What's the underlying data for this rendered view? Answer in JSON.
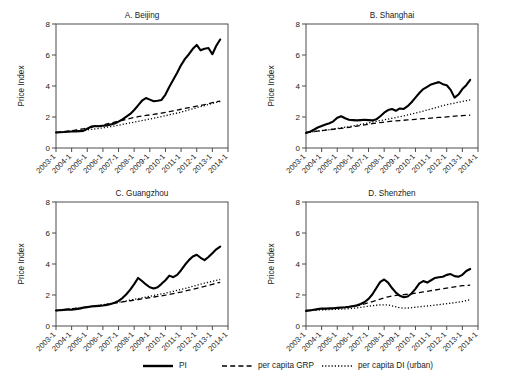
{
  "figure": {
    "ylabel": "Price Index",
    "legend": [
      {
        "name": "legend-pi",
        "label": "PI",
        "style": "solid"
      },
      {
        "name": "legend-grp",
        "label": "per capita GRP",
        "style": "dashed"
      },
      {
        "name": "legend-di",
        "label": "per capita DI (urban)",
        "style": "dotted"
      }
    ]
  },
  "chart_data": [
    {
      "type": "line",
      "title": "A. Beijing",
      "xlabel": "",
      "ylabel": "Price Index",
      "ylim": [
        0,
        8
      ],
      "yticks": [
        0,
        2,
        4,
        6,
        8
      ],
      "xlim": [
        2003.0,
        2014.0
      ],
      "xticks": [
        "2003-1",
        "2004-1",
        "2005-1",
        "2006-1",
        "2007-1",
        "2008-1",
        "2009-1",
        "2010-1",
        "2011-1",
        "2012-1",
        "2013-1",
        "2014-1"
      ],
      "grid": false,
      "legend_position": "below-figure",
      "x": [
        2003.0,
        2003.25,
        2003.5,
        2003.75,
        2004.0,
        2004.25,
        2004.5,
        2004.75,
        2005.0,
        2005.25,
        2005.5,
        2005.75,
        2006.0,
        2006.25,
        2006.5,
        2006.75,
        2007.0,
        2007.25,
        2007.5,
        2007.75,
        2008.0,
        2008.25,
        2008.5,
        2008.75,
        2009.0,
        2009.25,
        2009.5,
        2009.75,
        2010.0,
        2010.25,
        2010.5,
        2010.75,
        2011.0,
        2011.25,
        2011.5,
        2011.75,
        2012.0,
        2012.25,
        2012.5,
        2012.75,
        2013.0,
        2013.25,
        2013.5
      ],
      "series": [
        {
          "name": "PI",
          "style": "solid",
          "values": [
            1.0,
            1.02,
            1.03,
            1.05,
            1.06,
            1.07,
            1.09,
            1.1,
            1.24,
            1.38,
            1.42,
            1.4,
            1.44,
            1.46,
            1.52,
            1.58,
            1.7,
            1.85,
            2.02,
            2.2,
            2.45,
            2.75,
            3.05,
            3.22,
            3.12,
            3.02,
            3.05,
            3.1,
            3.45,
            3.95,
            4.4,
            4.85,
            5.35,
            5.75,
            6.05,
            6.4,
            6.65,
            6.3,
            6.4,
            6.45,
            6.05,
            6.6,
            7.0,
            7.55
          ],
          "values_note": "quarterly price index, Beijing"
        },
        {
          "name": "per capita GRP",
          "style": "dashed",
          "values": [
            1.0,
            1.03,
            1.06,
            1.09,
            1.12,
            1.16,
            1.2,
            1.24,
            1.28,
            1.33,
            1.38,
            1.43,
            1.49,
            1.55,
            1.61,
            1.67,
            1.73,
            1.79,
            1.85,
            1.91,
            1.97,
            2.02,
            2.06,
            2.1,
            2.13,
            2.17,
            2.21,
            2.25,
            2.3,
            2.35,
            2.4,
            2.45,
            2.5,
            2.55,
            2.6,
            2.65,
            2.7,
            2.75,
            2.8,
            2.86,
            2.92,
            2.98,
            3.02
          ]
        },
        {
          "name": "per capita DI (urban)",
          "style": "dotted",
          "values": [
            1.0,
            1.02,
            1.04,
            1.06,
            1.08,
            1.1,
            1.12,
            1.14,
            1.17,
            1.2,
            1.23,
            1.26,
            1.3,
            1.34,
            1.38,
            1.42,
            1.47,
            1.52,
            1.57,
            1.62,
            1.67,
            1.72,
            1.77,
            1.82,
            1.87,
            1.92,
            1.97,
            2.02,
            2.08,
            2.14,
            2.2,
            2.26,
            2.32,
            2.39,
            2.46,
            2.53,
            2.6,
            2.67,
            2.74,
            2.81,
            2.88,
            2.95,
            3.0
          ]
        }
      ]
    },
    {
      "type": "line",
      "title": "B. Shanghai",
      "xlabel": "",
      "ylabel": "Price Index",
      "ylim": [
        0,
        8
      ],
      "yticks": [
        0,
        2,
        4,
        6,
        8
      ],
      "xlim": [
        2003.0,
        2014.0
      ],
      "xticks": [
        "2003-1",
        "2004-1",
        "2005-1",
        "2006-1",
        "2007-1",
        "2008-1",
        "2009-1",
        "2010-1",
        "2011-1",
        "2012-1",
        "2013-1",
        "2014-1"
      ],
      "grid": false,
      "legend_position": "below-figure",
      "x": [
        2003.0,
        2003.25,
        2003.5,
        2003.75,
        2004.0,
        2004.25,
        2004.5,
        2004.75,
        2005.0,
        2005.25,
        2005.5,
        2005.75,
        2006.0,
        2006.25,
        2006.5,
        2006.75,
        2007.0,
        2007.25,
        2007.5,
        2007.75,
        2008.0,
        2008.25,
        2008.5,
        2008.75,
        2009.0,
        2009.25,
        2009.5,
        2009.75,
        2010.0,
        2010.25,
        2010.5,
        2010.75,
        2011.0,
        2011.25,
        2011.5,
        2011.75,
        2012.0,
        2012.25,
        2012.5,
        2012.75,
        2013.0,
        2013.25,
        2013.5
      ],
      "series": [
        {
          "name": "PI",
          "style": "solid",
          "values": [
            0.97,
            1.05,
            1.18,
            1.32,
            1.42,
            1.52,
            1.6,
            1.72,
            1.95,
            2.05,
            1.92,
            1.82,
            1.8,
            1.78,
            1.8,
            1.82,
            1.8,
            1.78,
            1.85,
            2.05,
            2.28,
            2.45,
            2.52,
            2.4,
            2.55,
            2.52,
            2.7,
            2.95,
            3.25,
            3.55,
            3.8,
            3.95,
            4.1,
            4.18,
            4.25,
            4.12,
            4.05,
            3.75,
            3.25,
            3.45,
            3.8,
            4.05,
            4.4
          ]
        },
        {
          "name": "per capita GRP",
          "style": "dashed",
          "values": [
            1.0,
            1.03,
            1.06,
            1.09,
            1.12,
            1.15,
            1.18,
            1.21,
            1.24,
            1.27,
            1.3,
            1.33,
            1.37,
            1.41,
            1.45,
            1.49,
            1.53,
            1.57,
            1.61,
            1.64,
            1.67,
            1.7,
            1.73,
            1.75,
            1.77,
            1.79,
            1.81,
            1.83,
            1.85,
            1.87,
            1.89,
            1.91,
            1.93,
            1.95,
            1.97,
            1.99,
            2.01,
            2.03,
            2.05,
            2.07,
            2.09,
            2.1,
            2.12
          ]
        },
        {
          "name": "per capita DI (urban)",
          "style": "dotted",
          "values": [
            1.0,
            1.03,
            1.06,
            1.09,
            1.12,
            1.15,
            1.18,
            1.22,
            1.26,
            1.3,
            1.34,
            1.38,
            1.42,
            1.47,
            1.52,
            1.57,
            1.62,
            1.67,
            1.72,
            1.77,
            1.82,
            1.87,
            1.92,
            1.97,
            2.02,
            2.07,
            2.13,
            2.19,
            2.25,
            2.31,
            2.38,
            2.45,
            2.52,
            2.59,
            2.66,
            2.73,
            2.8,
            2.85,
            2.9,
            2.95,
            3.0,
            3.05,
            3.1
          ]
        }
      ]
    },
    {
      "type": "line",
      "title": "C. Guangzhou",
      "xlabel": "",
      "ylabel": "Price Index",
      "ylim": [
        0,
        8
      ],
      "yticks": [
        0,
        2,
        4,
        6,
        8
      ],
      "xlim": [
        2003.0,
        2014.0
      ],
      "xticks": [
        "2003-1",
        "2004-1",
        "2005-1",
        "2006-1",
        "2007-1",
        "2008-1",
        "2009-1",
        "2010-1",
        "2011-1",
        "2012-1",
        "2013-1",
        "2014-1"
      ],
      "grid": false,
      "legend_position": "below-figure",
      "x": [
        2003.0,
        2003.25,
        2003.5,
        2003.75,
        2004.0,
        2004.25,
        2004.5,
        2004.75,
        2005.0,
        2005.25,
        2005.5,
        2005.75,
        2006.0,
        2006.25,
        2006.5,
        2006.75,
        2007.0,
        2007.25,
        2007.5,
        2007.75,
        2008.0,
        2008.25,
        2008.5,
        2008.75,
        2009.0,
        2009.25,
        2009.5,
        2009.75,
        2010.0,
        2010.25,
        2010.5,
        2010.75,
        2011.0,
        2011.25,
        2011.5,
        2011.75,
        2012.0,
        2012.25,
        2012.5,
        2012.75,
        2013.0,
        2013.25,
        2013.5
      ],
      "series": [
        {
          "name": "PI",
          "style": "solid",
          "values": [
            1.0,
            1.02,
            1.04,
            1.06,
            1.05,
            1.08,
            1.12,
            1.18,
            1.22,
            1.26,
            1.28,
            1.3,
            1.32,
            1.36,
            1.42,
            1.5,
            1.62,
            1.8,
            2.05,
            2.35,
            2.7,
            3.1,
            2.9,
            2.68,
            2.5,
            2.42,
            2.5,
            2.72,
            2.95,
            3.25,
            3.15,
            3.3,
            3.6,
            3.95,
            4.25,
            4.48,
            4.6,
            4.4,
            4.25,
            4.45,
            4.7,
            4.95,
            5.12
          ]
        },
        {
          "name": "per capita GRP",
          "style": "dashed",
          "values": [
            1.0,
            1.02,
            1.05,
            1.08,
            1.11,
            1.14,
            1.17,
            1.2,
            1.23,
            1.26,
            1.29,
            1.32,
            1.35,
            1.39,
            1.43,
            1.47,
            1.51,
            1.55,
            1.59,
            1.63,
            1.67,
            1.71,
            1.75,
            1.79,
            1.83,
            1.87,
            1.91,
            1.95,
            1.99,
            2.04,
            2.09,
            2.14,
            2.19,
            2.25,
            2.31,
            2.37,
            2.43,
            2.49,
            2.55,
            2.62,
            2.69,
            2.76,
            2.82
          ]
        },
        {
          "name": "per capita DI (urban)",
          "style": "dotted",
          "values": [
            1.0,
            1.02,
            1.05,
            1.08,
            1.11,
            1.14,
            1.17,
            1.2,
            1.23,
            1.26,
            1.29,
            1.33,
            1.37,
            1.41,
            1.45,
            1.49,
            1.53,
            1.57,
            1.62,
            1.67,
            1.72,
            1.77,
            1.82,
            1.87,
            1.92,
            1.97,
            2.02,
            2.07,
            2.12,
            2.18,
            2.24,
            2.3,
            2.36,
            2.42,
            2.49,
            2.56,
            2.63,
            2.7,
            2.76,
            2.82,
            2.88,
            2.94,
            3.0
          ]
        }
      ]
    },
    {
      "type": "line",
      "title": "D. Shenzhen",
      "xlabel": "",
      "ylabel": "Price Index",
      "ylim": [
        0,
        8
      ],
      "yticks": [
        0,
        2,
        4,
        6,
        8
      ],
      "xlim": [
        2003.0,
        2014.0
      ],
      "xticks": [
        "2003-1",
        "2004-1",
        "2005-1",
        "2006-1",
        "2007-1",
        "2008-1",
        "2009-1",
        "2010-1",
        "2011-1",
        "2012-1",
        "2013-1",
        "2014-1"
      ],
      "grid": false,
      "legend_position": "below-figure",
      "x": [
        2003.0,
        2003.25,
        2003.5,
        2003.75,
        2004.0,
        2004.25,
        2004.5,
        2004.75,
        2005.0,
        2005.25,
        2005.5,
        2005.75,
        2006.0,
        2006.25,
        2006.5,
        2006.75,
        2007.0,
        2007.25,
        2007.5,
        2007.75,
        2008.0,
        2008.25,
        2008.5,
        2008.75,
        2009.0,
        2009.25,
        2009.5,
        2009.75,
        2010.0,
        2010.25,
        2010.5,
        2010.75,
        2011.0,
        2011.25,
        2011.5,
        2011.75,
        2012.0,
        2012.25,
        2012.5,
        2012.75,
        2013.0,
        2013.25,
        2013.5
      ],
      "series": [
        {
          "name": "PI",
          "style": "solid",
          "values": [
            0.97,
            1.0,
            1.05,
            1.1,
            1.12,
            1.13,
            1.14,
            1.15,
            1.17,
            1.19,
            1.21,
            1.24,
            1.28,
            1.34,
            1.42,
            1.55,
            1.75,
            2.05,
            2.45,
            2.85,
            3.0,
            2.8,
            2.45,
            2.15,
            1.95,
            1.85,
            1.9,
            2.1,
            2.4,
            2.75,
            2.9,
            2.8,
            2.95,
            3.1,
            3.15,
            3.18,
            3.3,
            3.35,
            3.22,
            3.18,
            3.3,
            3.55,
            3.68
          ]
        },
        {
          "name": "per capita GRP",
          "style": "dashed",
          "values": [
            1.0,
            1.02,
            1.04,
            1.06,
            1.08,
            1.1,
            1.12,
            1.14,
            1.16,
            1.18,
            1.2,
            1.23,
            1.26,
            1.3,
            1.35,
            1.42,
            1.5,
            1.58,
            1.66,
            1.74,
            1.82,
            1.88,
            1.93,
            1.97,
            2.0,
            2.02,
            2.05,
            2.08,
            2.12,
            2.16,
            2.2,
            2.24,
            2.28,
            2.32,
            2.36,
            2.4,
            2.44,
            2.48,
            2.52,
            2.56,
            2.6,
            2.62,
            2.64
          ]
        },
        {
          "name": "per capita DI (urban)",
          "style": "dotted",
          "values": [
            1.0,
            1.01,
            1.02,
            1.03,
            1.04,
            1.05,
            1.06,
            1.07,
            1.08,
            1.09,
            1.1,
            1.12,
            1.14,
            1.17,
            1.2,
            1.24,
            1.28,
            1.31,
            1.34,
            1.36,
            1.37,
            1.35,
            1.3,
            1.24,
            1.18,
            1.15,
            1.16,
            1.18,
            1.21,
            1.24,
            1.27,
            1.29,
            1.32,
            1.35,
            1.38,
            1.41,
            1.44,
            1.47,
            1.5,
            1.54,
            1.58,
            1.64,
            1.7
          ]
        }
      ]
    }
  ]
}
